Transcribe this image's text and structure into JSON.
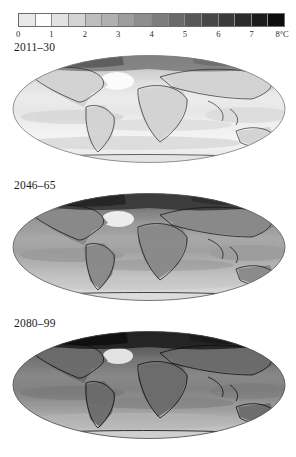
{
  "figure": {
    "colorbar": {
      "units_label": "8°C",
      "tick_labels": [
        "0",
        "1",
        "2",
        "3",
        "4",
        "5",
        "6",
        "7",
        "8°C"
      ],
      "tick_values": [
        0,
        1,
        2,
        3,
        4,
        5,
        6,
        7,
        8
      ],
      "step": 0.5,
      "n_cells": 16,
      "cell_colors": [
        "#e9e9e9",
        "#fdfdfd",
        "#e2e2e2",
        "#d4d4d4",
        "#bdbdbd",
        "#b0b0b0",
        "#9e9e9e",
        "#8e8e8e",
        "#7d7d7d",
        "#6a6a6a",
        "#585858",
        "#474747",
        "#3a3a3a",
        "#2b2b2b",
        "#1c1c1c",
        "#0d0d0d"
      ]
    },
    "panels": [
      {
        "id": "p1",
        "label": "2011–30"
      },
      {
        "id": "p2",
        "label": "2046–65"
      },
      {
        "id": "p3",
        "label": "2080–99"
      }
    ]
  },
  "chart_data": {
    "type": "heatmap",
    "title": "",
    "subtitle": "",
    "xlabel": "",
    "ylabel": "",
    "legend_position": "top",
    "grid": false,
    "projection": "robinson",
    "colorbar": {
      "label": "8°C",
      "min": 0,
      "max": 8,
      "step": 0.5,
      "ticks": [
        0,
        1,
        2,
        3,
        4,
        5,
        6,
        7,
        8
      ],
      "scale": "grayscale-light-to-dark"
    },
    "panels": [
      {
        "name": "2011–30",
        "global_mean_estimate": 0.9,
        "range": [
          0.3,
          3.5
        ],
        "regions": [
          {
            "name": "Arctic / Greenland",
            "value": 2.5
          },
          {
            "name": "Northern Canada & Siberia",
            "value": 1.7
          },
          {
            "name": "Northern mid-latitude land",
            "value": 1.2
          },
          {
            "name": "Tropical land",
            "value": 0.9
          },
          {
            "name": "Tropical ocean",
            "value": 0.6
          },
          {
            "name": "Southern Ocean",
            "value": 0.4
          },
          {
            "name": "North Atlantic cold patch",
            "value": 0.3
          },
          {
            "name": "Antarctica",
            "value": 0.6
          }
        ]
      },
      {
        "name": "2046–65",
        "global_mean_estimate": 2.3,
        "range": [
          0.8,
          6.0
        ],
        "regions": [
          {
            "name": "Arctic / Greenland",
            "value": 5.0
          },
          {
            "name": "Northern Canada & Siberia",
            "value": 3.8
          },
          {
            "name": "Northern mid-latitude land",
            "value": 2.8
          },
          {
            "name": "Tropical land",
            "value": 2.3
          },
          {
            "name": "Tropical ocean",
            "value": 1.7
          },
          {
            "name": "Southern Ocean",
            "value": 1.2
          },
          {
            "name": "North Atlantic cold patch",
            "value": 0.9
          },
          {
            "name": "Antarctica",
            "value": 1.4
          }
        ]
      },
      {
        "name": "2080–99",
        "global_mean_estimate": 3.6,
        "range": [
          1.2,
          8.0
        ],
        "regions": [
          {
            "name": "Arctic / Greenland",
            "value": 7.5
          },
          {
            "name": "Northern Canada & Siberia",
            "value": 5.8
          },
          {
            "name": "Northern mid-latitude land",
            "value": 4.3
          },
          {
            "name": "Tropical land",
            "value": 3.6
          },
          {
            "name": "Tropical ocean",
            "value": 2.7
          },
          {
            "name": "Southern Ocean",
            "value": 1.9
          },
          {
            "name": "North Atlantic cold patch",
            "value": 1.3
          },
          {
            "name": "Antarctica",
            "value": 2.2
          }
        ]
      }
    ]
  }
}
